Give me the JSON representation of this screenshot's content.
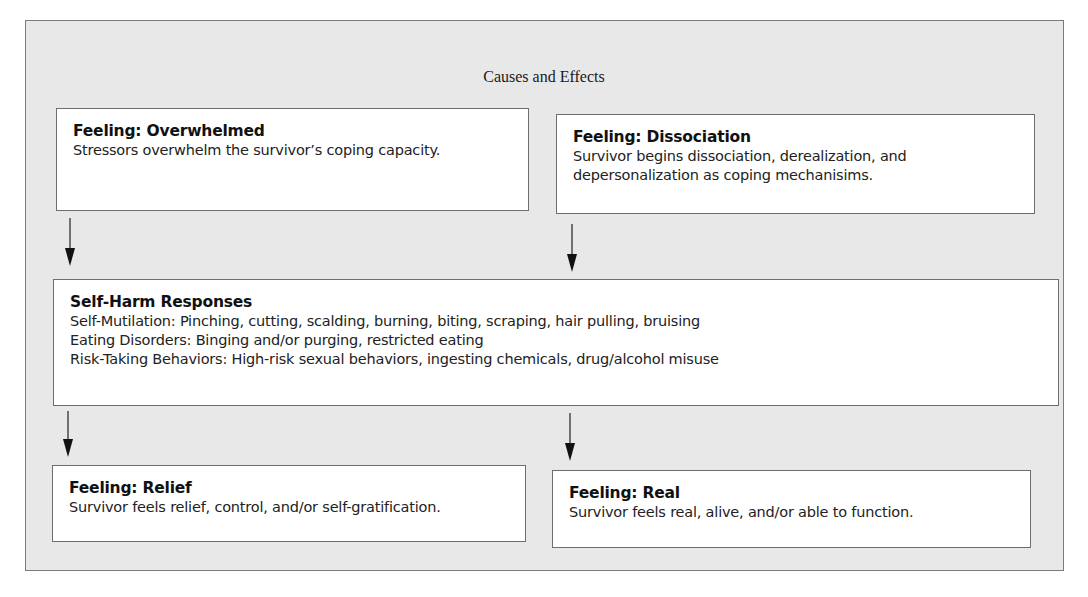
{
  "diagram": {
    "title": "Causes and Effects",
    "boxes": {
      "overwhelmed": {
        "heading": "Feeling: Overwhelmed",
        "text": "Stressors overwhelm the survivor’s coping capacity."
      },
      "dissociation": {
        "heading": "Feeling: Dissociation",
        "text": "Survivor begins dissociation, derealization, and depersonalization as coping mechanisims."
      },
      "self_harm": {
        "heading": "Self-Harm Responses",
        "lines": [
          "Self-Mutilation: Pinching, cutting, scalding, burning, biting, scraping, hair pulling, bruising",
          "Eating Disorders: Binging and/or purging, restricted eating",
          "Risk-Taking Behaviors: High-risk sexual behaviors, ingesting chemicals, drug/alcohol misuse"
        ]
      },
      "relief": {
        "heading": "Feeling: Relief",
        "text": "Survivor feels relief, control, and/or self-gratification."
      },
      "real": {
        "heading": "Feeling: Real",
        "text": "Survivor feels real, alive, and/or able to function."
      }
    },
    "arrows": [
      {
        "from": "overwhelmed",
        "to": "self_harm",
        "icon": "arrow-down-icon"
      },
      {
        "from": "dissociation",
        "to": "self_harm",
        "icon": "arrow-down-icon"
      },
      {
        "from": "self_harm",
        "to": "relief",
        "icon": "arrow-down-icon"
      },
      {
        "from": "self_harm",
        "to": "real",
        "icon": "arrow-down-icon"
      }
    ],
    "colors": {
      "panel_background": "#e8e8e8",
      "box_background": "#ffffff",
      "border": "#6e6e6e",
      "text": "#1a1a1a"
    }
  }
}
